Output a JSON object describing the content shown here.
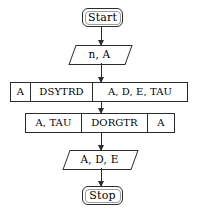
{
  "diagram": {
    "background_color": "#ffffff",
    "line_color": "#2b2b2b"
  },
  "nodes": {
    "start": {
      "label": "Start",
      "shape": "rounded-terminal"
    },
    "stop": {
      "label": "Stop",
      "shape": "rounded-terminal"
    },
    "io_input": {
      "label": "n, A",
      "shape": "parallelogram"
    },
    "io_output": {
      "label": "A, D, E",
      "shape": "parallelogram"
    },
    "dsytrd": {
      "input": "A",
      "name": "DSYTRD",
      "output": "A, D, E, TAU"
    },
    "dorgtr": {
      "input": "A, TAU",
      "name": "DORGTR",
      "output": "A"
    }
  },
  "connectors": [
    {
      "from": "start",
      "to": "io_input",
      "arrow": "down"
    },
    {
      "from": "io_input",
      "to": "dsytrd",
      "arrow": "down"
    },
    {
      "from": "dsytrd",
      "to": "dorgtr",
      "arrow": "down"
    },
    {
      "from": "dorgtr",
      "to": "io_output",
      "arrow": "down"
    },
    {
      "from": "io_output",
      "to": "stop",
      "arrow": "down"
    }
  ]
}
